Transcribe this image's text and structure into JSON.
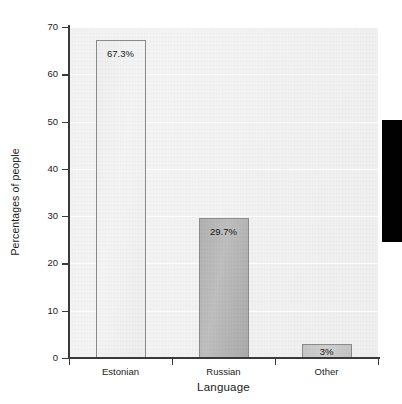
{
  "chart_data": {
    "type": "bar",
    "title": "",
    "subtitle": "",
    "xlabel": "Language",
    "ylabel": "Percentages of people",
    "categories": [
      "Estonian",
      "Russian",
      "Other"
    ],
    "values": [
      67.3,
      29.7,
      3
    ],
    "data_labels": [
      "67.3%",
      "29.7%",
      "3%"
    ],
    "ylim": [
      0,
      70
    ],
    "y_ticks": [
      0,
      10,
      20,
      30,
      40,
      50,
      60,
      70
    ],
    "y_tick_labels": [
      "0",
      "10",
      "20",
      "30",
      "40",
      "50",
      "60",
      "70"
    ],
    "grid": true,
    "grid_orientation": "horizontal",
    "legend": false,
    "legend_position": "none",
    "bar_colors": [
      "#efefef",
      "#b3b3b3",
      "#c8c8c8"
    ],
    "bar_border_color": "#8a8a8a",
    "plot_background": "#f2f2f2",
    "axis_color": "#3a3a3a",
    "text_color": "#1b1b1b",
    "series": [
      {
        "name": "Percentages of people",
        "values": [
          67.3,
          29.7,
          3
        ]
      }
    ]
  },
  "artifact": {
    "name": "black-scan-block",
    "color": "#010101"
  }
}
